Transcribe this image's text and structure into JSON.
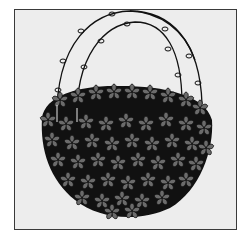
{
  "illustration": {
    "subject": "hanging flower basket",
    "colors": {
      "page_background": "#ffffff",
      "frame_background": "#ededed",
      "frame_border": "#3a3a3a",
      "petal_fill": "#6b6b6b",
      "outline": "#111111"
    }
  }
}
